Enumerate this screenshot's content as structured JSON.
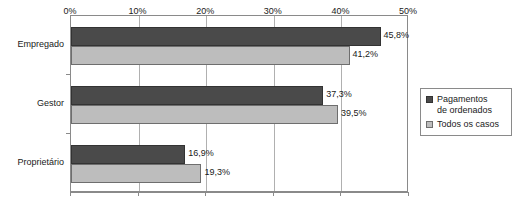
{
  "chart_data": {
    "type": "bar",
    "orientation": "horizontal",
    "title": "",
    "xlabel": "",
    "ylabel": "",
    "categories": [
      "Empregado",
      "Gestor",
      "Proprietário"
    ],
    "series": [
      {
        "name": "Pagamentos de ordenados",
        "color": "#4a4a4a",
        "values": [
          45.8,
          37.3,
          16.9
        ],
        "labels": [
          "45,8%",
          "37,3%",
          "16,9%"
        ]
      },
      {
        "name": "Todos os casos",
        "color": "#bdbdbd",
        "values": [
          41.2,
          39.5,
          19.3
        ],
        "labels": [
          "41,2%",
          "39,5%",
          "19,3%"
        ]
      }
    ],
    "xlim": [
      0,
      50
    ],
    "xticks": [
      0,
      10,
      20,
      30,
      40,
      50
    ],
    "xtick_labels": [
      "0%",
      "10%",
      "20%",
      "30%",
      "40%",
      "50%"
    ],
    "grid": true,
    "grid_axis": "x",
    "legend_position": "right"
  },
  "legend": {
    "items": [
      {
        "label_line1": "Pagamentos",
        "label_line2": "de ordenados"
      },
      {
        "label_line1": "Todos os casos",
        "label_line2": ""
      }
    ]
  }
}
